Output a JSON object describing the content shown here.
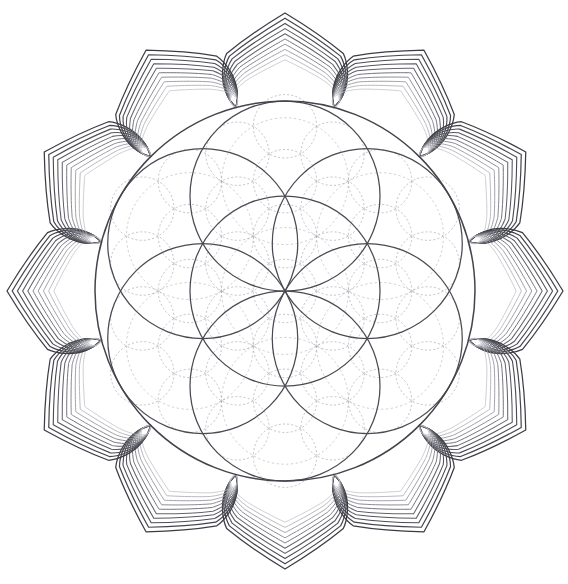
{
  "artwork": {
    "title": "Lotus Flower of Life Mandala",
    "kind": "geometric-line-drawing",
    "background_color": "#ffffff",
    "canvas": {
      "width": 568,
      "height": 584
    }
  },
  "geometry": {
    "center": {
      "x": 285,
      "y": 291
    },
    "main_circle_radius": 190,
    "petal_count": 12,
    "petal_angle_step_deg": 30,
    "petal_start_angle_deg": -90,
    "petal_nested_line_count": 10,
    "petal_tip_radius": 278,
    "petal_half_width_deg": 15,
    "petal_waist_factor": 0.62,
    "petal_nest_step": 5.2
  },
  "seed_of_life": {
    "description": "seven overlapping solid circles, one centred plus six around",
    "circle_count": 7,
    "circle_radius": 95,
    "ring_radius": 95,
    "ring_angle_offset_deg": -90,
    "stroke_color": "#4a4a52",
    "stroke_width": 1.25
  },
  "outer_boundary": {
    "description": "solid enclosing circle of the mandala",
    "radius": 190,
    "stroke_color": "#43434b",
    "stroke_width": 1.5
  },
  "fine_grid": {
    "description": "light dashed flower-of-life lattice filling the interior",
    "unit_radius": 31.7,
    "rings": 6,
    "stroke_color": "#8f8f9b",
    "stroke_width": 0.62,
    "dash_pattern": "2.1 2.1",
    "opacity": 0.85
  },
  "mid_grid": {
    "description": "medium dashed circles at twice the fine unit radius",
    "unit_radius": 63.4,
    "stroke_color": "#7e7e8b",
    "stroke_width": 0.6,
    "dash_pattern": "2.4 2.4",
    "opacity": 0.6
  },
  "palette": {
    "ink_darkest": "#3a3a42",
    "ink_dark": "#4a4a52",
    "ink_mid": "#6c6c78",
    "ink_light": "#9a9aa6",
    "ink_faint": "#c2c2cc",
    "background": "#ffffff"
  },
  "petal_line_shades": [
    "#3c3c44",
    "#43434b",
    "#4c4c55",
    "#57575f",
    "#63636c",
    "#70707a",
    "#808089",
    "#93939c",
    "#a8a8b1",
    "#bebec6"
  ]
}
